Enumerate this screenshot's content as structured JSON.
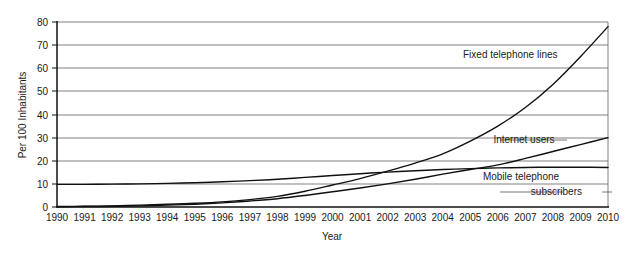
{
  "chart_data": {
    "type": "line",
    "title": "",
    "xlabel": "Year",
    "ylabel": "Per 100 Inhabitants",
    "xlim": [
      1990,
      2010
    ],
    "ylim": [
      0,
      80
    ],
    "grid": true,
    "legend_position": "inline-annotations",
    "x": [
      1990,
      1991,
      1992,
      1993,
      1994,
      1995,
      1996,
      1997,
      1998,
      1999,
      2000,
      2001,
      2002,
      2003,
      2004,
      2005,
      2006,
      2007,
      2008,
      2009,
      2010
    ],
    "xtick_labels": [
      "1990",
      "1991",
      "1992",
      "1993",
      "1994",
      "1995",
      "1996",
      "1997",
      "1998",
      "1999",
      "2000",
      "2001",
      "2002",
      "2003",
      "2004",
      "2005",
      "2006",
      "2007",
      "2008",
      "2009",
      "2010"
    ],
    "ytick_labels": [
      "0",
      "10",
      "20",
      "30",
      "40",
      "50",
      "60",
      "70",
      "80"
    ],
    "ytick_values": [
      0,
      10,
      20,
      30,
      40,
      50,
      60,
      70,
      80
    ],
    "series": [
      {
        "name": "Fixed telephone lines",
        "label": "Fixed telephone lines",
        "values": [
          0.2,
          0.3,
          0.5,
          0.8,
          1.2,
          1.6,
          2.2,
          3.2,
          4.6,
          6.8,
          9.5,
          12.3,
          15.5,
          19.0,
          23.0,
          28.5,
          35.0,
          43.0,
          53.0,
          65.0,
          78.0
        ]
      },
      {
        "name": "Internet users",
        "label": "Internet users",
        "values": [
          0.1,
          0.2,
          0.3,
          0.5,
          0.8,
          1.2,
          1.8,
          2.6,
          3.6,
          5.0,
          6.6,
          8.2,
          10.0,
          12.0,
          14.2,
          16.2,
          18.2,
          21.0,
          24.0,
          27.0,
          30.0
        ]
      },
      {
        "name": "Mobile telephone subscribers",
        "label_line_1": "Mobile telephone",
        "label_line_2": "subscribers",
        "values": [
          9.8,
          9.8,
          9.9,
          10.0,
          10.2,
          10.5,
          10.9,
          11.4,
          12.0,
          12.8,
          13.6,
          14.4,
          15.1,
          15.7,
          16.2,
          16.6,
          16.9,
          17.1,
          17.2,
          17.2,
          17.1
        ]
      }
    ]
  }
}
